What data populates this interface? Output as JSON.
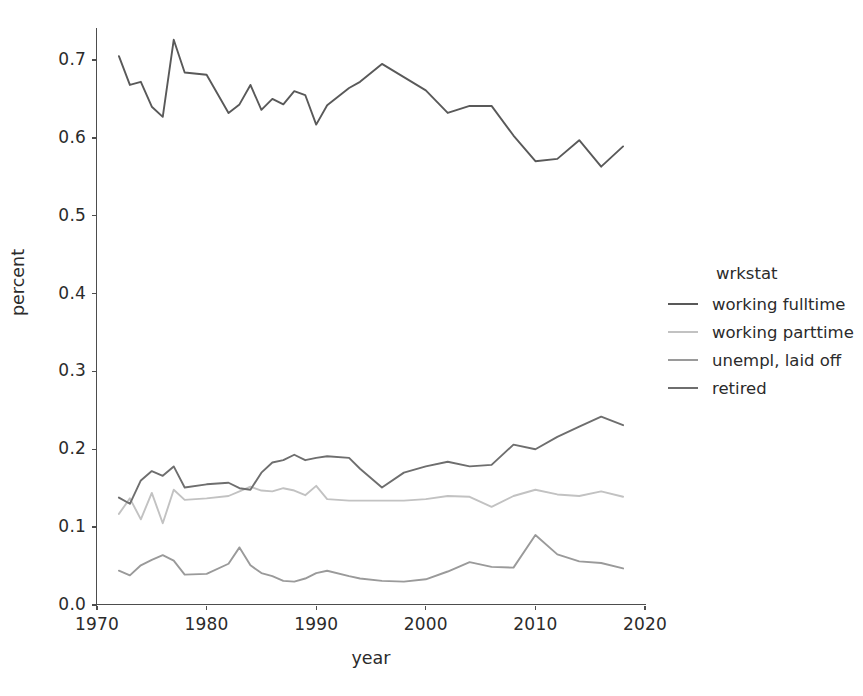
{
  "chart_data": {
    "type": "line",
    "title": "",
    "xlabel": "year",
    "ylabel": "percent",
    "xlim": [
      1970,
      2020
    ],
    "ylim": [
      0.0,
      0.745
    ],
    "grid": false,
    "legend_title": "wrkstat",
    "legend_position": "right",
    "xticks": [
      1970,
      1980,
      1990,
      2000,
      2010,
      2020
    ],
    "yticks": [
      "0.0",
      "0.1",
      "0.2",
      "0.3",
      "0.4",
      "0.5",
      "0.6",
      "0.7"
    ],
    "x": [
      1972,
      1973,
      1974,
      1975,
      1976,
      1977,
      1978,
      1980,
      1982,
      1983,
      1984,
      1985,
      1986,
      1987,
      1988,
      1989,
      1990,
      1991,
      1993,
      1994,
      1996,
      1998,
      2000,
      2002,
      2004,
      2006,
      2008,
      2010,
      2012,
      2014,
      2016,
      2018
    ],
    "series": [
      {
        "name": "working fulltime",
        "color": "#595959",
        "values": [
          0.705,
          0.668,
          0.672,
          0.64,
          0.627,
          0.726,
          0.684,
          0.681,
          0.632,
          0.643,
          0.668,
          0.636,
          0.65,
          0.643,
          0.66,
          0.655,
          0.617,
          0.642,
          0.664,
          0.672,
          0.695,
          0.678,
          0.661,
          0.632,
          0.641,
          0.641,
          0.603,
          0.57,
          0.573,
          0.597,
          0.563,
          0.589
        ]
      },
      {
        "name": "working parttime",
        "color": "#c2c2c2",
        "values": [
          0.117,
          0.137,
          0.11,
          0.144,
          0.105,
          0.148,
          0.135,
          0.137,
          0.14,
          0.146,
          0.152,
          0.147,
          0.146,
          0.15,
          0.147,
          0.141,
          0.153,
          0.136,
          0.134,
          0.134,
          0.134,
          0.134,
          0.136,
          0.14,
          0.139,
          0.126,
          0.14,
          0.148,
          0.142,
          0.14,
          0.146,
          0.139
        ]
      },
      {
        "name": "unempl, laid off",
        "color": "#9a9a9a",
        "values": [
          0.044,
          0.038,
          0.051,
          0.058,
          0.064,
          0.057,
          0.039,
          0.04,
          0.053,
          0.074,
          0.051,
          0.041,
          0.037,
          0.031,
          0.03,
          0.034,
          0.041,
          0.044,
          0.037,
          0.034,
          0.031,
          0.03,
          0.033,
          0.043,
          0.055,
          0.049,
          0.048,
          0.09,
          0.065,
          0.056,
          0.054,
          0.047
        ]
      },
      {
        "name": "retired",
        "color": "#6e6e6e",
        "values": [
          0.138,
          0.13,
          0.16,
          0.172,
          0.166,
          0.178,
          0.151,
          0.155,
          0.157,
          0.15,
          0.148,
          0.17,
          0.183,
          0.186,
          0.193,
          0.186,
          0.189,
          0.191,
          0.189,
          0.175,
          0.151,
          0.17,
          0.178,
          0.184,
          0.178,
          0.18,
          0.206,
          0.2,
          0.216,
          0.229,
          0.242,
          0.231
        ]
      }
    ]
  },
  "axes": {
    "x_title": "year",
    "y_title": "percent",
    "xticklabels": [
      "1970",
      "1980",
      "1990",
      "2000",
      "2010",
      "2020"
    ],
    "yticklabels": [
      "0.0",
      "0.1",
      "0.2",
      "0.3",
      "0.4",
      "0.5",
      "0.6",
      "0.7"
    ]
  },
  "legend": {
    "title": "wrkstat",
    "items": [
      {
        "label": "working fulltime",
        "color": "#595959"
      },
      {
        "label": "working parttime",
        "color": "#c2c2c2"
      },
      {
        "label": "unempl, laid off",
        "color": "#9a9a9a"
      },
      {
        "label": "retired",
        "color": "#6e6e6e"
      }
    ]
  },
  "style": {
    "background": "#ffffff",
    "spine_color": "#4d4d4d",
    "text_color": "#2b2b2b"
  }
}
